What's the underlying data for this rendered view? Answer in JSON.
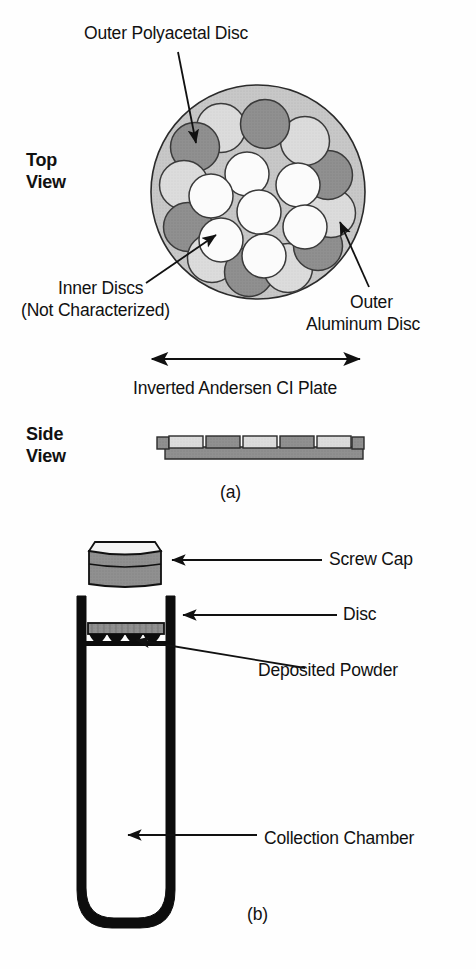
{
  "figure": {
    "title_top_view": "Top\nView",
    "title_side_view": "Side\nView",
    "caption_a": "(a)",
    "caption_b": "(b)"
  },
  "panel_a": {
    "labels": {
      "outer_polyacetal_disc": "Outer Polyacetal Disc",
      "inner_discs_line1": "Inner Discs",
      "inner_discs_line2": "(Not Characterized)",
      "outer_aluminum_line1": "Outer",
      "outer_aluminum_line2": "Aluminum Disc",
      "inverted_plate": "Inverted Andersen CI Plate"
    },
    "top_view": {
      "plate_fill": "#c8c8c8",
      "plate_stroke": "#2b2b2b",
      "disc_light": "#d9d9d9",
      "disc_dark": "#8c8c8c",
      "disc_white": "#fbfbfb",
      "outer_disc_count": 12,
      "inner_disc_count": 7,
      "outer_discs": [
        {
          "index": 1,
          "shade": "light"
        },
        {
          "index": 2,
          "shade": "dark"
        },
        {
          "index": 3,
          "shade": "light"
        },
        {
          "index": 4,
          "shade": "dark"
        },
        {
          "index": 5,
          "shade": "light"
        },
        {
          "index": 6,
          "shade": "dark"
        },
        {
          "index": 7,
          "shade": "light"
        },
        {
          "index": 8,
          "shade": "dark"
        },
        {
          "index": 9,
          "shade": "light"
        },
        {
          "index": 10,
          "shade": "dark"
        },
        {
          "index": 11,
          "shade": "light"
        },
        {
          "index": 12,
          "shade": "dark"
        }
      ]
    },
    "side_view": {
      "segment_count": 5,
      "segments": [
        {
          "index": 1,
          "shade": "light"
        },
        {
          "index": 2,
          "shade": "dark"
        },
        {
          "index": 3,
          "shade": "light"
        },
        {
          "index": 4,
          "shade": "dark"
        },
        {
          "index": 5,
          "shade": "light"
        }
      ],
      "base_fill": "#9a9a9a",
      "light_fill": "#d4d4d4",
      "dark_fill": "#8f8f8f"
    }
  },
  "panel_b": {
    "labels": {
      "screw_cap": "Screw Cap",
      "disc": "Disc",
      "deposited_powder": "Deposited Powder",
      "collection_chamber": "Collection Chamber"
    },
    "screw_cap": {
      "top_fill": "#f2f2f2",
      "body_fill": "#9e9e9e",
      "stroke": "#111111"
    },
    "disc": {
      "fill": "#b5b5b5",
      "stroke": "#111111"
    },
    "deposited_powder": {
      "scallop_count": 4,
      "fill": "#111111"
    },
    "chamber": {
      "wall_color": "#0d0d0d",
      "interior": "#ffffff"
    }
  },
  "colors": {
    "background": "#fefefe",
    "ink": "#111111",
    "plate_gray": "#c8c8c8",
    "disc_light_gray": "#d9d9d9",
    "disc_dark_gray": "#8c8c8c",
    "disc_white": "#fbfbfb"
  }
}
